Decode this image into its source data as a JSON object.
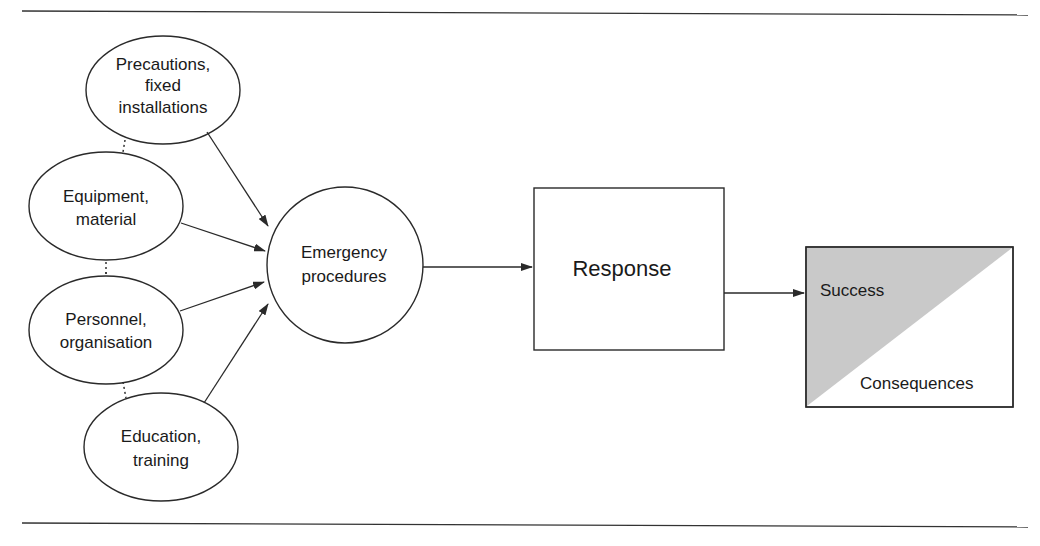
{
  "diagram": {
    "inputs": [
      {
        "id": "precautions",
        "lines": [
          "Precautions,",
          "fixed",
          "installations"
        ]
      },
      {
        "id": "equipment",
        "lines": [
          "Equipment,",
          "material"
        ]
      },
      {
        "id": "personnel",
        "lines": [
          "Personnel,",
          "organisation"
        ]
      },
      {
        "id": "education",
        "lines": [
          "Education,",
          "training"
        ]
      }
    ],
    "hub": {
      "lines": [
        "Emergency",
        "procedures"
      ]
    },
    "response": {
      "label": "Response"
    },
    "outcome": {
      "success": "Success",
      "consequences": "Consequences"
    },
    "colors": {
      "stroke": "#2a2a2a",
      "success_fill": "#c9c9c9",
      "background": "#ffffff"
    }
  }
}
